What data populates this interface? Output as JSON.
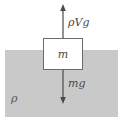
{
  "figure": {
    "width": 123,
    "height": 117
  },
  "fluid": {
    "label": "ρ",
    "name": "fluid-region",
    "color": "#c9c9c9"
  },
  "block": {
    "label": "m",
    "name": "mass-block",
    "fill": "#ffffff",
    "stroke": "#6b6b6b"
  },
  "forces": [
    {
      "name": "buoyant-force",
      "label": "ρVg",
      "direction": "up",
      "color": "#4a4a4a"
    },
    {
      "name": "weight-force",
      "label": "mg",
      "direction": "down",
      "color": "#4a4a4a"
    }
  ],
  "colors": {
    "fluid": "#c9c9c9",
    "stroke": "#6b6b6b",
    "arrow": "#4a4a4a",
    "background": "#ffffff"
  }
}
